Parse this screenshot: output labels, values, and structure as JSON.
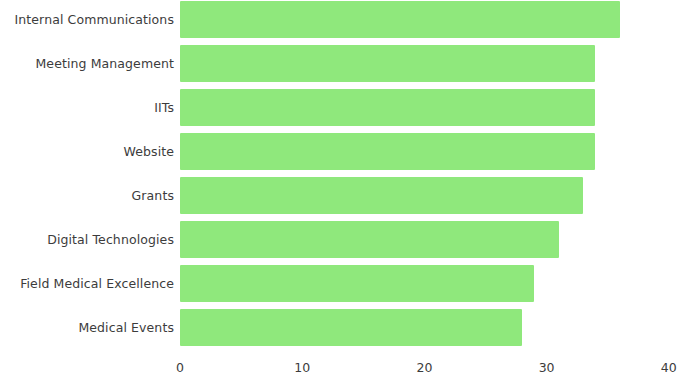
{
  "chart_data": {
    "type": "bar",
    "orientation": "horizontal",
    "title": "",
    "xlabel": "",
    "ylabel": "",
    "xlim": [
      0,
      40
    ],
    "grid": false,
    "legend": null,
    "bar_color": "#8fe87c",
    "text_color": "#3c3c3c",
    "xticks": [
      "0",
      "10",
      "20",
      "30",
      "40"
    ],
    "xtick_values": [
      0,
      10,
      20,
      30,
      40
    ],
    "categories": [
      "Internal Communications",
      "Meeting Management",
      "IITs",
      "Website",
      "Grants",
      "Digital Technologies",
      "Field Medical Excellence",
      "Medical Events"
    ],
    "values": [
      36,
      34,
      34,
      34,
      33,
      31,
      29,
      28
    ]
  }
}
